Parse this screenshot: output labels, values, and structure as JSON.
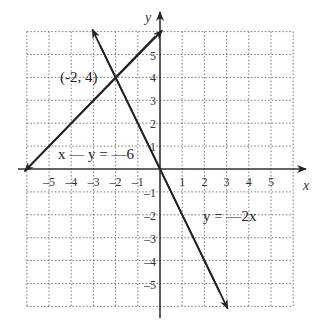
{
  "chart_data": {
    "type": "line",
    "title": "",
    "xlabel": "x",
    "ylabel": "y",
    "xlim": [
      -6,
      6
    ],
    "ylim": [
      -6,
      6
    ],
    "grid": true,
    "x_ticks": [
      "-5",
      "-4",
      "-3",
      "-2",
      "-1",
      "1",
      "2",
      "3",
      "4",
      "5"
    ],
    "y_ticks": [
      "5",
      "4",
      "3",
      "2",
      "1",
      "-1",
      "-2",
      "-3",
      "-4",
      "-5"
    ],
    "series": [
      {
        "name": "x — y = —6",
        "equation": "y = x + 6",
        "x": [
          -6,
          0
        ],
        "y": [
          0,
          6
        ]
      },
      {
        "name": "y = —2x",
        "equation": "y = -2x",
        "x": [
          -3,
          3
        ],
        "y": [
          6,
          -6
        ]
      }
    ],
    "annotations": [
      {
        "text": "(-2, 4)",
        "x": -2,
        "y": 4
      }
    ]
  },
  "labels": {
    "x_axis": "x",
    "y_axis": "y",
    "line1": "x — y = —6",
    "line2": "y = —2x",
    "point": "(-2, 4)"
  }
}
